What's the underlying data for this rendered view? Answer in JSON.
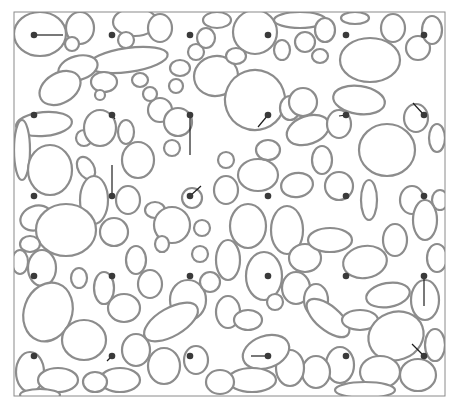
{
  "figure": {
    "frame": {
      "x": 14,
      "y": 12,
      "w": 431,
      "h": 384,
      "stroke": "#8a8a8a"
    },
    "colors": {
      "background": "#ffffff",
      "boundary": "#8c8c8c",
      "boundary_dark": "#6a6a6a",
      "dot": "#3a3a3a",
      "segment": "#1e1e1e"
    },
    "grid": {
      "columns_x": [
        34,
        112,
        190,
        268,
        346,
        424
      ],
      "rows_y": [
        35,
        115,
        196,
        276,
        356
      ],
      "dot_radius": 3.3
    },
    "segments": [
      {
        "from": [
          34,
          35
        ],
        "to": [
          63,
          35
        ]
      },
      {
        "from": [
          112,
          115
        ],
        "to": [
          115,
          119
        ]
      },
      {
        "from": [
          190,
          115
        ],
        "to": [
          190,
          155
        ]
      },
      {
        "from": [
          268,
          115
        ],
        "to": [
          258,
          127
        ]
      },
      {
        "from": [
          346,
          115
        ],
        "to": [
          339,
          116
        ]
      },
      {
        "from": [
          424,
          115
        ],
        "to": [
          413,
          103
        ]
      },
      {
        "from": [
          112,
          196
        ],
        "to": [
          112,
          165
        ]
      },
      {
        "from": [
          190,
          196
        ],
        "to": [
          201,
          186
        ]
      },
      {
        "from": [
          424,
          276
        ],
        "to": [
          424,
          306
        ]
      },
      {
        "from": [
          112,
          356
        ],
        "to": [
          107,
          361
        ]
      },
      {
        "from": [
          268,
          356
        ],
        "to": [
          251,
          356
        ]
      },
      {
        "from": [
          424,
          356
        ],
        "to": [
          412,
          344
        ]
      }
    ],
    "grains": [
      [
        40,
        34,
        26,
        22,
        0
      ],
      [
        80,
        28,
        14,
        16,
        0
      ],
      [
        72,
        44,
        7,
        7,
        0
      ],
      [
        135,
        22,
        22,
        14,
        0
      ],
      [
        126,
        40,
        8,
        8,
        0
      ],
      [
        160,
        28,
        12,
        14,
        0
      ],
      [
        128,
        60,
        40,
        12,
        -8
      ],
      [
        78,
        68,
        20,
        12,
        -15
      ],
      [
        60,
        88,
        22,
        15,
        -30
      ],
      [
        104,
        82,
        13,
        10,
        0
      ],
      [
        100,
        95,
        5,
        5,
        0
      ],
      [
        180,
        68,
        10,
        8,
        0
      ],
      [
        176,
        86,
        7,
        7,
        0
      ],
      [
        196,
        52,
        8,
        8,
        0
      ],
      [
        206,
        38,
        9,
        10,
        0
      ],
      [
        217,
        20,
        14,
        8,
        0
      ],
      [
        216,
        76,
        22,
        20,
        -10
      ],
      [
        255,
        32,
        22,
        22,
        0
      ],
      [
        236,
        56,
        10,
        8,
        0
      ],
      [
        300,
        20,
        26,
        8,
        0
      ],
      [
        282,
        50,
        8,
        10,
        0
      ],
      [
        305,
        42,
        10,
        10,
        0
      ],
      [
        320,
        56,
        8,
        7,
        0
      ],
      [
        325,
        30,
        10,
        12,
        0
      ],
      [
        370,
        60,
        30,
        22,
        0
      ],
      [
        393,
        28,
        12,
        14,
        0
      ],
      [
        418,
        48,
        12,
        12,
        0
      ],
      [
        432,
        30,
        10,
        14,
        0
      ],
      [
        355,
        18,
        14,
        6,
        0
      ],
      [
        255,
        100,
        30,
        30,
        -20
      ],
      [
        290,
        108,
        10,
        12,
        0
      ],
      [
        308,
        130,
        22,
        14,
        -20
      ],
      [
        303,
        102,
        14,
        14,
        0
      ],
      [
        359,
        100,
        26,
        14,
        8
      ],
      [
        339,
        124,
        12,
        14,
        0
      ],
      [
        387,
        150,
        28,
        26,
        0
      ],
      [
        416,
        118,
        12,
        14,
        0
      ],
      [
        437,
        138,
        8,
        14,
        0
      ],
      [
        44,
        124,
        28,
        12,
        -5
      ],
      [
        22,
        150,
        8,
        30,
        0
      ],
      [
        50,
        170,
        22,
        25,
        0
      ],
      [
        84,
        138,
        8,
        8,
        0
      ],
      [
        100,
        128,
        16,
        18,
        0
      ],
      [
        126,
        132,
        8,
        12,
        0
      ],
      [
        138,
        160,
        16,
        18,
        0
      ],
      [
        160,
        110,
        12,
        12,
        0
      ],
      [
        150,
        94,
        7,
        7,
        0
      ],
      [
        140,
        80,
        8,
        7,
        0
      ],
      [
        178,
        122,
        14,
        14,
        0
      ],
      [
        172,
        148,
        8,
        8,
        0
      ],
      [
        86,
        168,
        8,
        12,
        -30
      ],
      [
        94,
        200,
        14,
        24,
        0
      ],
      [
        128,
        200,
        12,
        14,
        0
      ],
      [
        155,
        210,
        10,
        8,
        0
      ],
      [
        192,
        198,
        10,
        10,
        0
      ],
      [
        226,
        190,
        12,
        14,
        0
      ],
      [
        226,
        160,
        8,
        8,
        0
      ],
      [
        258,
        175,
        20,
        16,
        0
      ],
      [
        297,
        185,
        16,
        12,
        -10
      ],
      [
        322,
        160,
        10,
        14,
        0
      ],
      [
        339,
        186,
        14,
        14,
        0
      ],
      [
        369,
        200,
        8,
        20,
        0
      ],
      [
        412,
        200,
        12,
        14,
        0
      ],
      [
        440,
        200,
        8,
        10,
        0
      ],
      [
        268,
        150,
        12,
        10,
        0
      ],
      [
        36,
        218,
        16,
        12,
        -20
      ],
      [
        66,
        230,
        30,
        26,
        0
      ],
      [
        30,
        244,
        10,
        8,
        0
      ],
      [
        42,
        268,
        14,
        18,
        0
      ],
      [
        79,
        278,
        8,
        10,
        0
      ],
      [
        114,
        232,
        14,
        14,
        0
      ],
      [
        136,
        260,
        10,
        14,
        0
      ],
      [
        172,
        225,
        18,
        18,
        0
      ],
      [
        162,
        244,
        7,
        8,
        0
      ],
      [
        188,
        300,
        18,
        20,
        0
      ],
      [
        202,
        228,
        8,
        8,
        0
      ],
      [
        248,
        226,
        18,
        22,
        0
      ],
      [
        287,
        230,
        16,
        24,
        0
      ],
      [
        228,
        260,
        12,
        20,
        0
      ],
      [
        264,
        276,
        18,
        24,
        0
      ],
      [
        305,
        258,
        16,
        14,
        0
      ],
      [
        330,
        240,
        22,
        12,
        0
      ],
      [
        365,
        262,
        22,
        16,
        -10
      ],
      [
        395,
        240,
        12,
        16,
        0
      ],
      [
        425,
        220,
        12,
        20,
        0
      ],
      [
        437,
        258,
        10,
        14,
        0
      ],
      [
        20,
        262,
        8,
        12,
        0
      ],
      [
        48,
        312,
        24,
        30,
        20
      ],
      [
        84,
        340,
        22,
        20,
        0
      ],
      [
        104,
        288,
        10,
        16,
        0
      ],
      [
        124,
        308,
        16,
        14,
        0
      ],
      [
        150,
        284,
        12,
        14,
        0
      ],
      [
        171,
        322,
        30,
        14,
        -30
      ],
      [
        136,
        350,
        14,
        16,
        0
      ],
      [
        164,
        366,
        16,
        18,
        0
      ],
      [
        196,
        360,
        12,
        14,
        0
      ],
      [
        120,
        380,
        20,
        12,
        0
      ],
      [
        200,
        254,
        8,
        8,
        0
      ],
      [
        210,
        282,
        10,
        10,
        0
      ],
      [
        228,
        312,
        12,
        16,
        0
      ],
      [
        248,
        320,
        14,
        10,
        0
      ],
      [
        275,
        302,
        8,
        8,
        0
      ],
      [
        296,
        288,
        14,
        16,
        0
      ],
      [
        316,
        300,
        12,
        16,
        0
      ],
      [
        328,
        318,
        26,
        12,
        40
      ],
      [
        360,
        320,
        18,
        10,
        0
      ],
      [
        388,
        295,
        22,
        12,
        -10
      ],
      [
        396,
        336,
        28,
        24,
        -20
      ],
      [
        425,
        300,
        14,
        20,
        0
      ],
      [
        435,
        345,
        10,
        16,
        0
      ],
      [
        418,
        375,
        18,
        16,
        0
      ],
      [
        380,
        372,
        20,
        16,
        0
      ],
      [
        340,
        365,
        14,
        18,
        0
      ],
      [
        316,
        372,
        14,
        16,
        0
      ],
      [
        290,
        368,
        14,
        18,
        0
      ],
      [
        266,
        352,
        24,
        16,
        -20
      ],
      [
        252,
        380,
        24,
        12,
        0
      ],
      [
        220,
        382,
        14,
        12,
        0
      ],
      [
        365,
        390,
        30,
        8,
        0
      ],
      [
        30,
        372,
        14,
        20,
        0
      ],
      [
        58,
        380,
        20,
        12,
        0
      ],
      [
        95,
        382,
        12,
        10,
        0
      ],
      [
        40,
        395,
        20,
        6,
        0
      ]
    ]
  }
}
